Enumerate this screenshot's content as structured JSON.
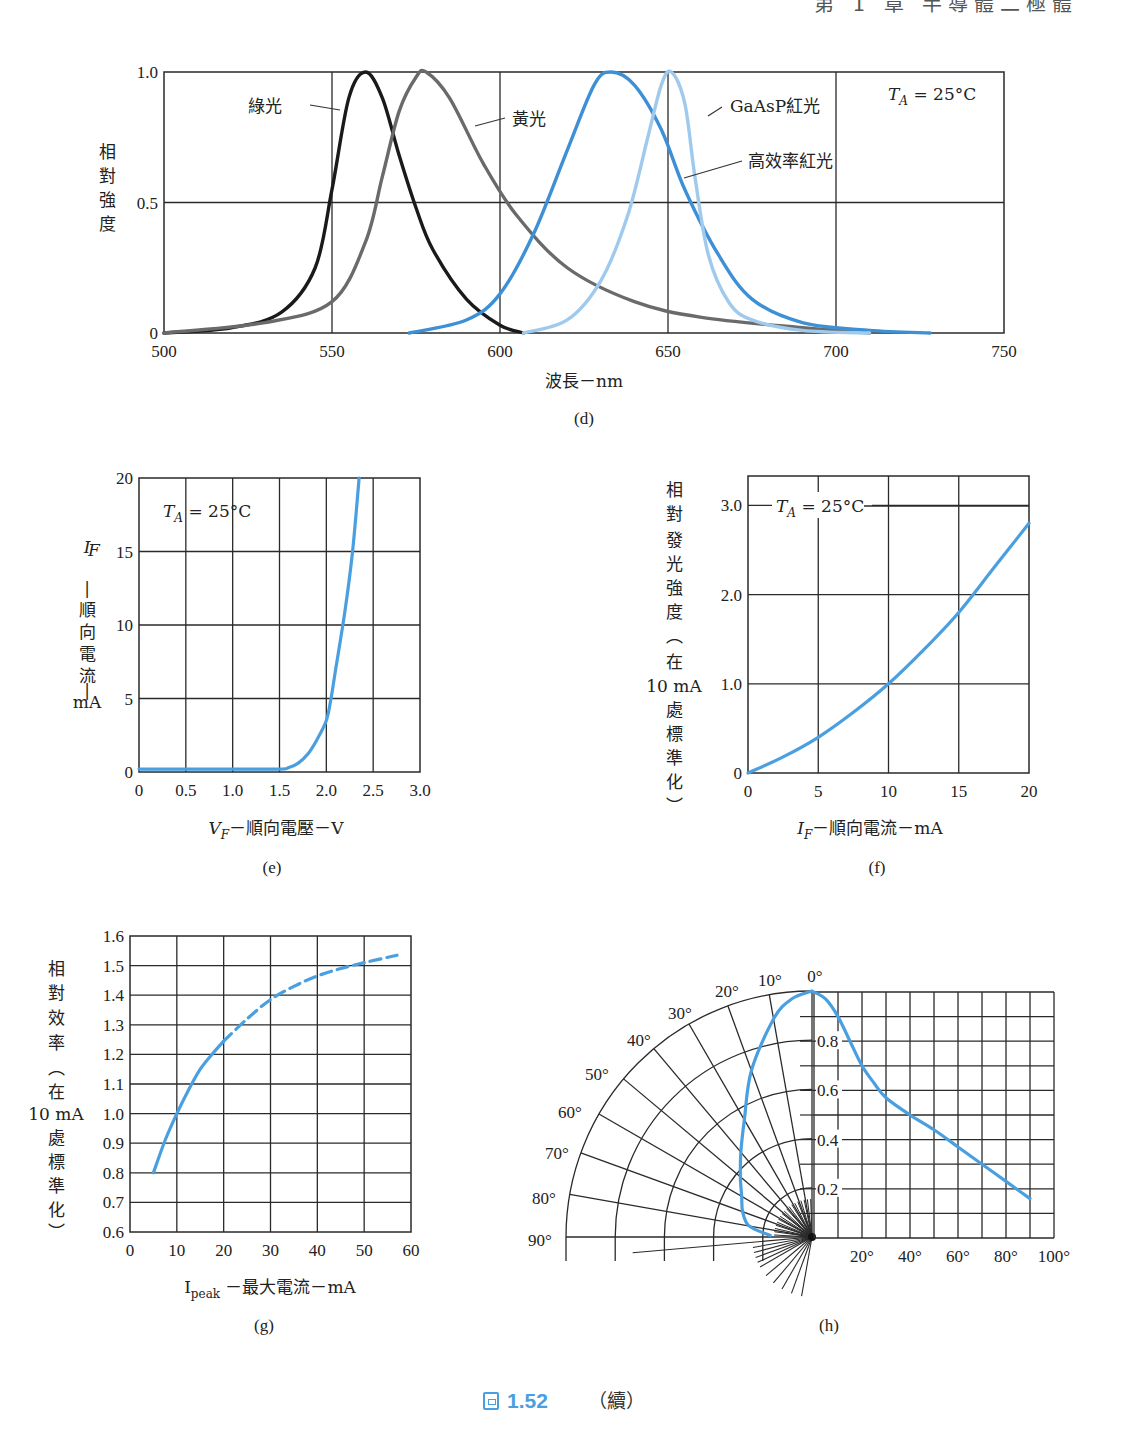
{
  "page": {
    "header": "第 1 章 半導體二極體",
    "figure_number": "1.52",
    "figure_suffix": "（續）",
    "accent_color": "#4a9fe0"
  },
  "chart_data": [
    {
      "id": "d",
      "type": "line",
      "caption": "(d)",
      "title": "",
      "xlabel": "波長－nm",
      "ylabel": "相對強度",
      "xlim": [
        500,
        750
      ],
      "ylim": [
        0,
        1.0
      ],
      "xticks": [
        500,
        550,
        600,
        650,
        700,
        750
      ],
      "yticks": [
        0,
        0.5,
        1.0
      ],
      "ytick_labels": [
        "0",
        "0.5",
        "1.0"
      ],
      "grid": true,
      "annotation": "T_A = 25°C",
      "series": [
        {
          "name": "綠光",
          "color": "#1a1a1a",
          "peak": 560,
          "x": [
            500,
            520,
            535,
            545,
            550,
            555,
            560,
            565,
            570,
            575,
            580,
            590,
            600,
            607
          ],
          "values": [
            0.0,
            0.02,
            0.08,
            0.25,
            0.55,
            0.9,
            1.0,
            0.9,
            0.68,
            0.48,
            0.32,
            0.13,
            0.03,
            0.0
          ]
        },
        {
          "name": "黃光",
          "color": "#6a6a6a",
          "peak": 578,
          "x": [
            500,
            530,
            550,
            560,
            565,
            570,
            575,
            578,
            585,
            595,
            605,
            620,
            640,
            660,
            690,
            710
          ],
          "values": [
            0.0,
            0.04,
            0.12,
            0.35,
            0.6,
            0.85,
            0.98,
            1.0,
            0.9,
            0.65,
            0.45,
            0.25,
            0.12,
            0.06,
            0.02,
            0.0
          ]
        },
        {
          "name": "高效率紅光",
          "color": "#3d8fd6",
          "peak": 633,
          "x": [
            573,
            590,
            600,
            610,
            620,
            628,
            633,
            640,
            648,
            655,
            665,
            675,
            690,
            710,
            728
          ],
          "values": [
            0.0,
            0.05,
            0.15,
            0.38,
            0.7,
            0.95,
            1.0,
            0.95,
            0.78,
            0.55,
            0.3,
            0.13,
            0.04,
            0.01,
            0.0
          ]
        },
        {
          "name": "GaAsP紅光",
          "color": "#9fcaed",
          "peak": 651,
          "x": [
            607,
            620,
            630,
            638,
            644,
            648,
            651,
            655,
            658,
            662,
            668,
            675,
            690,
            710
          ],
          "values": [
            0.0,
            0.05,
            0.2,
            0.45,
            0.75,
            0.95,
            1.0,
            0.88,
            0.6,
            0.3,
            0.12,
            0.05,
            0.01,
            0.0
          ]
        }
      ]
    },
    {
      "id": "e",
      "type": "line",
      "caption": "(e)",
      "xlabel": "V_F－順向電壓－V",
      "ylabel": "I_F－順向電流－mA",
      "ylabel_lines": [
        "I",
        "F",
        "|",
        "順",
        "向",
        "電",
        "流",
        "|",
        "mA"
      ],
      "xlim": [
        0,
        3.0
      ],
      "ylim": [
        0,
        20
      ],
      "xticks": [
        "0",
        "0.5",
        "1.0",
        "1.5",
        "2.0",
        "2.5",
        "3.0"
      ],
      "yticks": [
        "0",
        "5",
        "10",
        "15",
        "20"
      ],
      "grid": true,
      "annotation": "T_A = 25°C",
      "series": [
        {
          "name": "I_F",
          "color": "#4a9fe0",
          "x": [
            0,
            0.5,
            1.0,
            1.5,
            1.6,
            1.7,
            1.8,
            1.9,
            2.0,
            2.05,
            2.1,
            2.2,
            2.28,
            2.35
          ],
          "values": [
            0.2,
            0.2,
            0.2,
            0.2,
            0.3,
            0.6,
            1.2,
            2.2,
            3.5,
            5.0,
            7.0,
            11.0,
            15.0,
            20.0
          ]
        }
      ]
    },
    {
      "id": "f",
      "type": "line",
      "caption": "(f)",
      "xlabel": "I_F－順向電流－mA",
      "ylabel": "相對發光強度（在 10 mA 處標準化）",
      "ylabel_lines": [
        "相",
        "對",
        "發",
        "光",
        "強",
        "度",
        "︵",
        "在",
        "10 mA",
        "處",
        "標",
        "準",
        "化",
        "︶"
      ],
      "xlim": [
        0,
        20
      ],
      "ylim": [
        0,
        3.33
      ],
      "xticks": [
        "0",
        "5",
        "10",
        "15",
        "20"
      ],
      "yticks": [
        "0",
        "1.0",
        "2.0",
        "3.0"
      ],
      "grid": true,
      "annotation": "T_A = 25°C",
      "series": [
        {
          "name": "relative luminous intensity",
          "color": "#4a9fe0",
          "x": [
            0,
            2.5,
            5,
            7.5,
            10,
            12.5,
            15,
            17.5,
            20
          ],
          "values": [
            0.0,
            0.18,
            0.4,
            0.68,
            1.0,
            1.38,
            1.8,
            2.3,
            2.8
          ]
        }
      ]
    },
    {
      "id": "g",
      "type": "line",
      "caption": "(g)",
      "xlabel": "I_peak－最大電流－mA",
      "ylabel": "相對效率（在 10 mA 處標準化）",
      "ylabel_lines": [
        "相",
        "對",
        "效",
        "率",
        "︵",
        "在",
        "10 mA",
        "處",
        "標",
        "準",
        "化",
        "︶"
      ],
      "xlim": [
        0,
        60
      ],
      "ylim": [
        0.6,
        1.6
      ],
      "xticks": [
        "0",
        "10",
        "20",
        "30",
        "40",
        "50",
        "60"
      ],
      "yticks": [
        "0.6",
        "0.7",
        "0.8",
        "0.9",
        "1.0",
        "1.1",
        "1.2",
        "1.3",
        "1.4",
        "1.5",
        "1.6"
      ],
      "grid": true,
      "series": [
        {
          "name": "measured (solid)",
          "color": "#4a9fe0",
          "style": "solid",
          "x": [
            5,
            7.5,
            10,
            12.5,
            15,
            17.5,
            20
          ],
          "values": [
            0.8,
            0.91,
            1.0,
            1.08,
            1.15,
            1.2,
            1.245
          ]
        },
        {
          "name": "extrapolated (dashed)",
          "color": "#4a9fe0",
          "style": "dashed",
          "x": [
            20,
            25,
            30,
            35,
            40,
            45,
            50,
            57
          ],
          "values": [
            1.245,
            1.32,
            1.385,
            1.43,
            1.465,
            1.49,
            1.51,
            1.535
          ]
        }
      ]
    },
    {
      "id": "h",
      "type": "line",
      "caption": "(h)",
      "polar": {
        "angle_labels": [
          "0°",
          "10°",
          "20°",
          "30°",
          "40°",
          "50°",
          "60°",
          "70°",
          "80°",
          "90°"
        ],
        "angles": [
          0,
          10,
          20,
          30,
          40,
          50,
          60,
          70,
          80,
          90
        ]
      },
      "xlim": [
        0,
        100
      ],
      "ylim": [
        0,
        1.0
      ],
      "xticks": [
        "20°",
        "40°",
        "60°",
        "80°",
        "100°"
      ],
      "yticks": [
        "0.2",
        "0.4",
        "0.6",
        "0.8"
      ],
      "grid": true,
      "series": [
        {
          "name": "relative intensity vs angle",
          "color": "#4a9fe0",
          "x": [
            0,
            5,
            10,
            15,
            20,
            25,
            30,
            40,
            50,
            60,
            70,
            80,
            90
          ],
          "values": [
            1.0,
            0.97,
            0.9,
            0.8,
            0.7,
            0.63,
            0.57,
            0.5,
            0.44,
            0.37,
            0.3,
            0.23,
            0.16
          ]
        }
      ]
    }
  ]
}
